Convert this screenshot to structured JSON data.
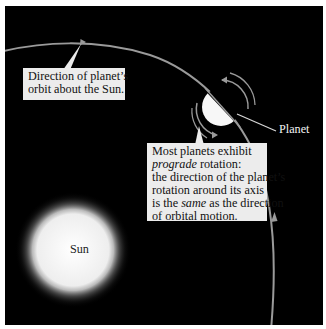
{
  "diagram": {
    "colors": {
      "background": "#000000",
      "frame": "#ffffff",
      "orbit": "#9a9a9a",
      "callout_bg": "#ececec",
      "callout_text": "#111111",
      "planet_lit": "#f7f7f7",
      "sun_core": "#f4f4f4"
    },
    "objects": {
      "sun": {
        "label": "Sun"
      },
      "planet": {
        "label": "Planet"
      }
    },
    "callouts": {
      "orbit": {
        "lines": [
          "Direction of planet’s",
          "orbit about the Sun."
        ]
      },
      "rotation": {
        "line1": "Most planets exhibit",
        "line2_italic": "prograde",
        "line2_rest": " rotation:",
        "line3": "the direction of the planet’s",
        "line4": "rotation around its axis",
        "line5_pre": "is the ",
        "line5_italic": "same",
        "line5_post": " as the direction",
        "line6": "of orbital motion."
      }
    },
    "arrows": {
      "orbit_direction": "counterclockwise",
      "rotation_direction": "counterclockwise"
    }
  }
}
